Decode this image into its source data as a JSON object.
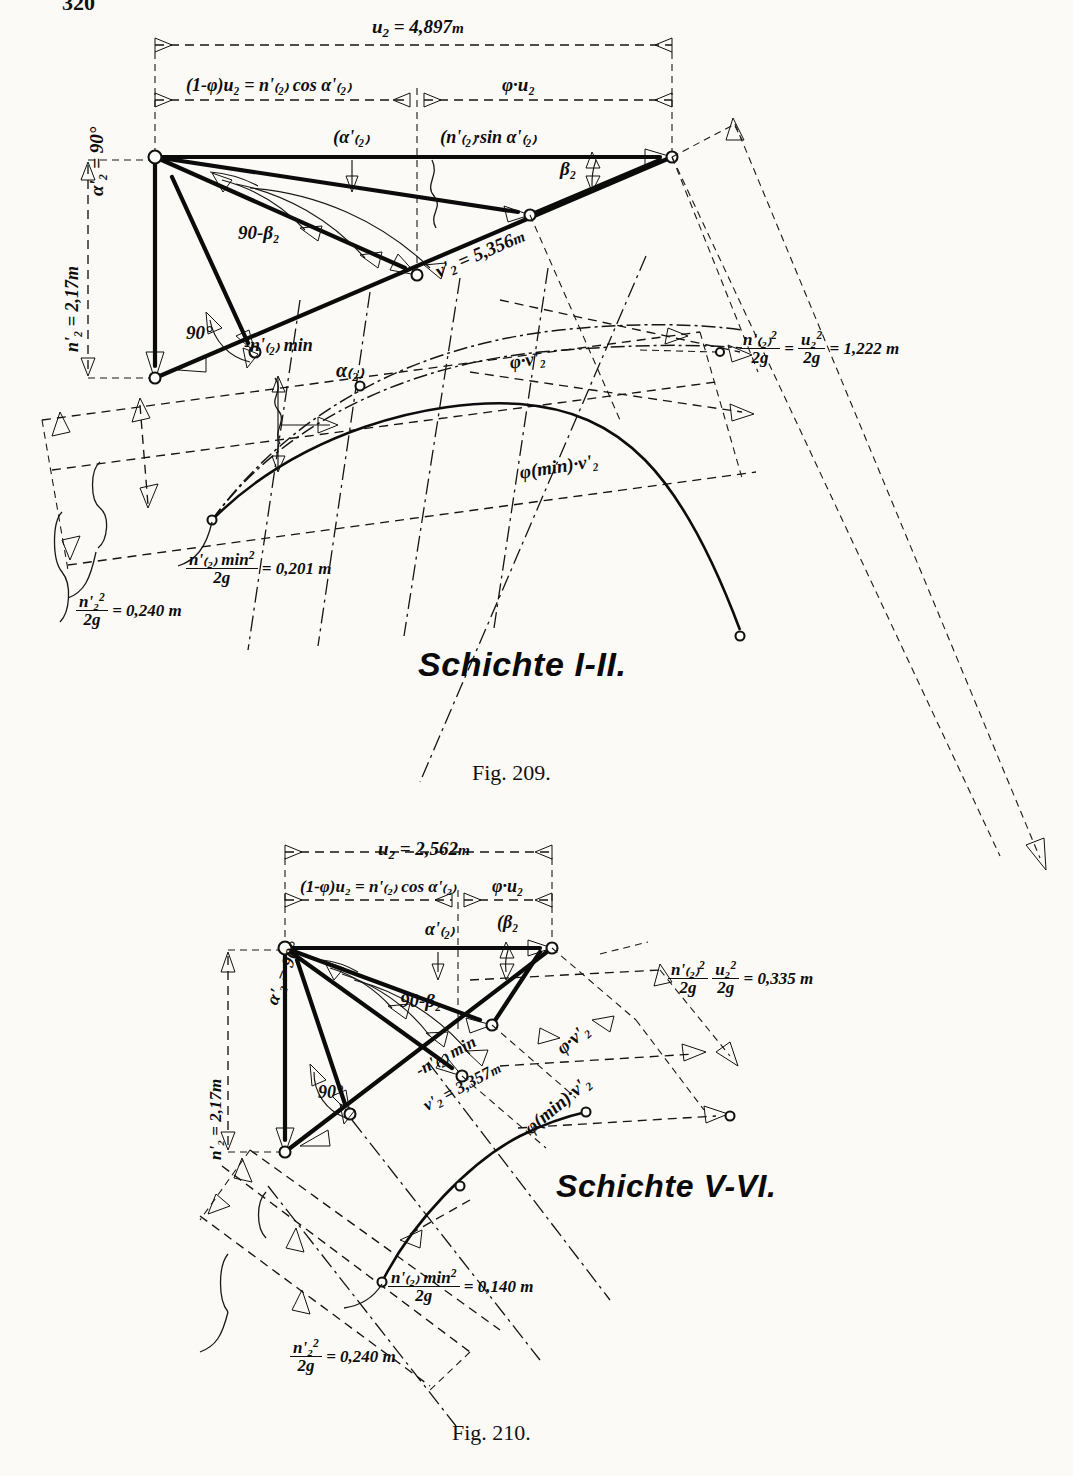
{
  "page": {
    "number": "320"
  },
  "figures": [
    {
      "id": "fig-209",
      "caption": "Fig. 209.",
      "layer_title": "Schichte I-II.",
      "labels": {
        "u2": {
          "var": "u",
          "sub": "2",
          "eq": "= 4,897",
          "unit": "m"
        },
        "left_segment": "(1-φ)u₂ = n'₍₂₎ cos α'₍₂₎",
        "right_segment": "φ·u₂",
        "alpha_2_bracket": "α'₍₂₎",
        "n_sin_alpha": "n'₍₂₎·sin α'₍₂₎",
        "beta_2": "β₂",
        "alpha_prime_90": "α'₂ = 90°",
        "n_prime_2_height": "n'₂ = 2,17m",
        "angle_90_minus_beta": "90-β₂",
        "angle_90": "90°",
        "n_2_min": "n'₍₂₎ min",
        "v_prime_2": {
          "var": "v'",
          "sub": "2",
          "eq": "= 5,356",
          "unit": "m"
        },
        "phi_v2": "φ·v'₂",
        "phi_min_v2": "φ(min)·v'₂",
        "alpha_2_curve": "α₍₂₎",
        "head_equation": {
          "n_top": "n'₍₂₎",
          "n_bot": "2g",
          "u_top": "u₂",
          "u_bot": "2g",
          "value": "= 1,222 m"
        },
        "head_min": {
          "top": "n'₍₂₎ min",
          "bot": "2g",
          "value": "= 0,201 m"
        },
        "head_n2": {
          "top": "n'₂",
          "bot": "2g",
          "value": "= 0,240 m"
        }
      }
    },
    {
      "id": "fig-210",
      "caption": "Fig. 210.",
      "layer_title": "Schichte V-VI.",
      "labels": {
        "u2": {
          "var": "u",
          "sub": "2",
          "eq": "= 2,562",
          "unit": "m"
        },
        "left_segment": "(1-φ)u₂ = n'₍₂₎ cos α'₍₂₎",
        "right_segment": "φ·u₂",
        "alpha_2_bracket": "α'₍₂₎",
        "beta_2": "β₂",
        "alpha_prime_90": "α'₂ = 90°",
        "n_prime_2_height": "n'₂ = 2,17m",
        "angle_90_minus_beta": "90-β₂",
        "angle_90": "90°",
        "n_2_min": "n'₍₂₎ min",
        "v_prime_2": {
          "var": "v'",
          "sub": "2",
          "eq": "= 3,357",
          "unit": "m"
        },
        "phi_v2": "φ·v'₂",
        "phi_min_v2": "φ(min)·v'₂",
        "head_equation": {
          "n_top": "n'₍₂₎",
          "n_bot": "2g",
          "u_top": "u₂",
          "u_bot": "2g",
          "value": "= 0,335 m"
        },
        "head_min": {
          "top": "n'₍₂₎ min",
          "bot": "2g",
          "value": "= 0,140 m"
        },
        "head_n2": {
          "top": "n'₂",
          "bot": "2g",
          "value": "= 0,240 m"
        }
      }
    }
  ],
  "colors": {
    "ink": "#111111",
    "paper": "#fbfaf7"
  }
}
